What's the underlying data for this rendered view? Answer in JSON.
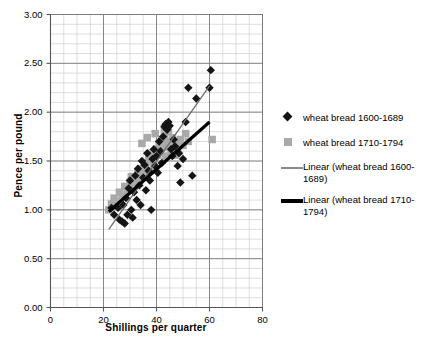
{
  "chart_data": {
    "type": "scatter",
    "title": "",
    "xlabel": "Shillings per quarter",
    "ylabel": "Pence per pound",
    "xlim": [
      0,
      80
    ],
    "ylim": [
      0.0,
      3.0
    ],
    "xticks": [
      "0",
      "20",
      "40",
      "60",
      "80"
    ],
    "yticks": [
      "0.00",
      "0.50",
      "1.00",
      "1.50",
      "2.00",
      "2.50",
      "3.00"
    ],
    "xtick_values": [
      0,
      20,
      40,
      60,
      80
    ],
    "ytick_values": [
      0.0,
      0.5,
      1.0,
      1.5,
      2.0,
      2.5,
      3.0
    ],
    "x_minor_step": 5,
    "y_minor_step": 0.1,
    "grid": true,
    "legend_position": "right",
    "series": [
      {
        "name": "wheat bread 1600-1689",
        "marker": "diamond",
        "color": "#151515",
        "points": [
          [
            23.0,
            1.02
          ],
          [
            24.0,
            0.95
          ],
          [
            25.5,
            1.02
          ],
          [
            26.0,
            0.9
          ],
          [
            27.0,
            0.88
          ],
          [
            27.5,
            1.05
          ],
          [
            28.0,
            0.86
          ],
          [
            28.5,
            1.12
          ],
          [
            29.0,
            0.95
          ],
          [
            29.5,
            1.22
          ],
          [
            30.0,
            1.3
          ],
          [
            30.5,
            1.0
          ],
          [
            31.0,
            0.92
          ],
          [
            31.5,
            1.18
          ],
          [
            32.0,
            1.35
          ],
          [
            32.5,
            1.1
          ],
          [
            33.0,
            1.42
          ],
          [
            33.5,
            1.25
          ],
          [
            34.0,
            1.05
          ],
          [
            34.5,
            1.5
          ],
          [
            35.0,
            1.33
          ],
          [
            35.5,
            1.46
          ],
          [
            36.0,
            1.2
          ],
          [
            36.5,
            1.58
          ],
          [
            37.0,
            1.4
          ],
          [
            37.5,
            1.3
          ],
          [
            38.0,
            1.0
          ],
          [
            38.5,
            1.52
          ],
          [
            39.0,
            1.62
          ],
          [
            39.5,
            1.45
          ],
          [
            40.0,
            1.55
          ],
          [
            40.5,
            1.38
          ],
          [
            41.0,
            1.7
          ],
          [
            41.5,
            1.6
          ],
          [
            42.0,
            1.48
          ],
          [
            42.5,
            1.75
          ],
          [
            43.0,
            1.85
          ],
          [
            43.5,
            1.88
          ],
          [
            44.0,
            1.82
          ],
          [
            44.5,
            1.9
          ],
          [
            45.0,
            1.86
          ],
          [
            45.5,
            1.62
          ],
          [
            46.0,
            1.55
          ],
          [
            46.5,
            1.72
          ],
          [
            47.0,
            1.65
          ],
          [
            48.0,
            1.45
          ],
          [
            48.5,
            1.58
          ],
          [
            49.0,
            1.28
          ],
          [
            50.0,
            1.52
          ],
          [
            51.0,
            1.9
          ],
          [
            52.0,
            2.25
          ],
          [
            53.5,
            1.35
          ],
          [
            55.0,
            2.14
          ],
          [
            60.5,
            2.43
          ],
          [
            60.0,
            2.25
          ]
        ]
      },
      {
        "name": "wheat bread 1710-1794",
        "marker": "square",
        "color": "#a9a9a9",
        "points": [
          [
            22.0,
            1.0
          ],
          [
            23.0,
            1.06
          ],
          [
            24.0,
            1.12
          ],
          [
            25.0,
            1.08
          ],
          [
            26.0,
            1.18
          ],
          [
            27.0,
            1.15
          ],
          [
            28.0,
            1.24
          ],
          [
            29.0,
            1.2
          ],
          [
            30.0,
            1.28
          ],
          [
            30.5,
            1.34
          ],
          [
            31.0,
            1.26
          ],
          [
            32.0,
            1.32
          ],
          [
            33.0,
            1.38
          ],
          [
            33.5,
            1.3
          ],
          [
            34.0,
            1.42
          ],
          [
            35.0,
            1.36
          ],
          [
            35.5,
            1.48
          ],
          [
            36.0,
            1.44
          ],
          [
            37.0,
            1.52
          ],
          [
            37.5,
            1.4
          ],
          [
            38.0,
            1.58
          ],
          [
            38.5,
            1.5
          ],
          [
            39.0,
            1.46
          ],
          [
            40.0,
            1.62
          ],
          [
            40.5,
            1.56
          ],
          [
            41.0,
            1.68
          ],
          [
            41.5,
            1.6
          ],
          [
            42.0,
            1.72
          ],
          [
            42.5,
            1.64
          ],
          [
            43.0,
            1.76
          ],
          [
            43.5,
            1.55
          ],
          [
            44.0,
            1.7
          ],
          [
            44.5,
            1.8
          ],
          [
            45.0,
            1.66
          ],
          [
            45.5,
            1.58
          ],
          [
            46.0,
            1.74
          ],
          [
            46.5,
            1.62
          ],
          [
            47.0,
            1.56
          ],
          [
            47.5,
            1.68
          ],
          [
            48.0,
            1.6
          ],
          [
            49.0,
            1.72
          ],
          [
            50.0,
            1.66
          ],
          [
            51.0,
            1.78
          ],
          [
            52.0,
            1.7
          ],
          [
            34.5,
            1.68
          ],
          [
            36.5,
            1.74
          ],
          [
            39.5,
            1.78
          ],
          [
            43.0,
            1.84
          ],
          [
            61.0,
            1.72
          ]
        ]
      }
    ],
    "trendlines": [
      {
        "name": "Linear (wheat bread 1600-1689)",
        "style": "thin",
        "color": "#6e6e6e",
        "width": 1.3,
        "x0": 22.0,
        "y0": 0.8,
        "x1": 60.0,
        "y1": 2.27
      },
      {
        "name": "Linear (wheat bread 1710-1794)",
        "style": "thick",
        "color": "#000000",
        "width": 3.2,
        "x0": 22.0,
        "y0": 0.98,
        "x1": 60.0,
        "y1": 1.9
      }
    ]
  },
  "legend": {
    "entries": [
      {
        "label": "wheat bread 1600-1689",
        "marker": "diamond"
      },
      {
        "label": "wheat bread 1710-1794",
        "marker": "square"
      },
      {
        "label": "Linear (wheat bread 1600-1689)",
        "marker": "line-thin"
      },
      {
        "label": "Linear (wheat bread 1710-1794)",
        "marker": "line-thick"
      }
    ]
  },
  "colors": {
    "series1": "#151515",
    "series2": "#a9a9a9",
    "trend1": "#6e6e6e",
    "trend2": "#000000",
    "grid_major": "#7d7d7d",
    "grid_minor": "#cfcfcf",
    "axis": "#555555"
  }
}
